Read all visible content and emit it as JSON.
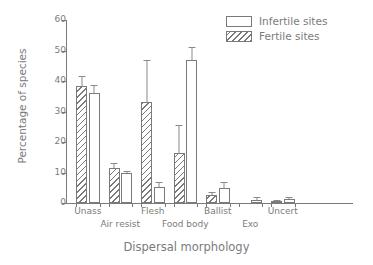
{
  "chart_data": {
    "type": "bar",
    "title": "",
    "xlabel": "Dispersal morphology",
    "ylabel": "Percentage of species",
    "ylim": [
      0,
      60
    ],
    "yticks": [
      0,
      10,
      20,
      30,
      40,
      50,
      60
    ],
    "ytick_labels": [
      "0",
      "10",
      "20",
      "30",
      "40",
      "50",
      "60"
    ],
    "grid": false,
    "legend_position": "top-right",
    "categories": [
      "Unass",
      "Air resist",
      "Flesh",
      "Food body",
      "Ballist",
      "Exo",
      "Uncert"
    ],
    "series": [
      {
        "name": "Fertile sites",
        "style": "hatched",
        "values": [
          38.5,
          11.5,
          33.2,
          16.3,
          2.6,
          0.0,
          0.5
        ],
        "errors": [
          3.0,
          1.6,
          13.8,
          9.3,
          0.9,
          0.0,
          0.4
        ]
      },
      {
        "name": "Infertile sites",
        "style": "open",
        "values": [
          36.2,
          9.9,
          5.4,
          47.0,
          4.8,
          1.0,
          1.2
        ],
        "errors": [
          2.6,
          0.6,
          1.6,
          4.0,
          2.2,
          1.0,
          0.9
        ]
      }
    ]
  },
  "legend": {
    "items": [
      {
        "label": "Infertile sites",
        "style": "open"
      },
      {
        "label": "Fertile sites",
        "style": "hatched"
      }
    ]
  },
  "axes": {
    "y_title": "Percentage of species",
    "x_title": "Dispersal morphology",
    "y_ticks": [
      "0",
      "10",
      "20",
      "30",
      "40",
      "50",
      "60"
    ],
    "x_ticks_row1": [
      "Unass",
      "Flesh",
      "Ballist",
      "Uncert"
    ],
    "x_ticks_row2": [
      "Air resist",
      "Food body",
      "Exo"
    ]
  },
  "colors": {
    "axis": "#7a7a7a",
    "text": "#7b7b7b",
    "bar_edge": "#7a7a7a",
    "bar_fill": "#ffffff",
    "error_bar": "#8a8a8a",
    "background": "#ffffff"
  }
}
